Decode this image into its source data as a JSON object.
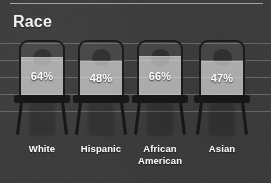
{
  "header": {
    "title": "Race"
  },
  "chart_data": {
    "type": "bar",
    "title": "Race",
    "xlabel": "",
    "ylabel": "",
    "ylim": [
      0,
      100
    ],
    "grid": true,
    "legend": "none",
    "value_suffix": "%",
    "categories": [
      "White",
      "Hispanic",
      "African American",
      "Asian"
    ],
    "values": [
      64,
      48,
      66,
      47
    ],
    "value_labels": [
      "64%",
      "48%",
      "66%",
      "47%"
    ],
    "points": [
      {
        "category": "White",
        "label_line1": "White",
        "label_line2": "",
        "value": 64,
        "value_label": "64%"
      },
      {
        "category": "Hispanic",
        "label_line1": "Hispanic",
        "label_line2": "",
        "value": 48,
        "value_label": "48%"
      },
      {
        "category": "African American",
        "label_line1": "African",
        "label_line2": "American",
        "value": 66,
        "value_label": "66%"
      },
      {
        "category": "Asian",
        "label_line1": "Asian",
        "label_line2": "",
        "value": 47,
        "value_label": "47%"
      }
    ]
  },
  "colors": {
    "background": "#3b3b3b",
    "title_text": "#f2f2f2",
    "label_text": "#ffffff",
    "bar_fill": "#e9e9e9",
    "chair_outline": "#1b1b1b",
    "gridline": "#c8c8c8"
  }
}
